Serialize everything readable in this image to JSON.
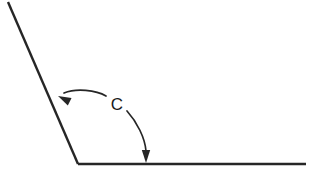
{
  "diagram": {
    "kind": "geometry-angle-diagram",
    "background_color": "#ffffff",
    "stroke_color": "#262626",
    "label_color": "#1a1a1a",
    "canvas": {
      "width": 317,
      "height": 178
    },
    "vertex": {
      "name": "vertex",
      "x": 78,
      "y": 164
    },
    "rays": [
      {
        "name": "upper-left-ray",
        "from": {
          "x": 78,
          "y": 164
        },
        "to": {
          "x": 8,
          "y": 2
        },
        "stroke_width": 2.4,
        "direction": "up-left"
      },
      {
        "name": "horizontal-right-ray",
        "from": {
          "x": 78,
          "y": 164
        },
        "to": {
          "x": 306,
          "y": 164
        },
        "stroke_width": 2.4,
        "direction": "right"
      }
    ],
    "angle_label": {
      "name": "angle-label-c",
      "text": "C",
      "x": 117,
      "y": 106,
      "font_size": 17
    },
    "arcs": [
      {
        "name": "arc-left-segment",
        "path": "M 106,96 C 96,90 76,88 64,93",
        "stroke_width": 1.7,
        "arrow_at": "end",
        "arrow_tip": {
          "x": 58,
          "y": 96
        },
        "arrow_angle_deg": 206
      },
      {
        "name": "arc-right-segment",
        "path": "M 127,111 C 137,122 145,138 146,151",
        "stroke_width": 1.7,
        "arrow_at": "end",
        "arrow_tip": {
          "x": 146,
          "y": 163
        },
        "arrow_angle_deg": 90
      }
    ],
    "arrow_head_size": {
      "length": 13,
      "half_width": 4.2
    }
  }
}
